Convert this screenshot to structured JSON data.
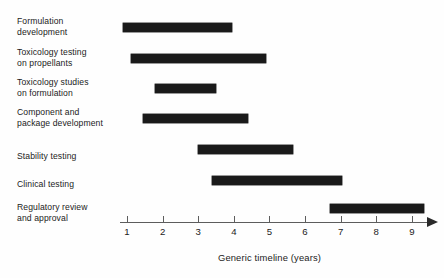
{
  "chart_data": {
    "type": "bar",
    "subtype": "gantt",
    "title": "",
    "xlabel": "Generic timeline (years)",
    "ylabel": "",
    "xlim": [
      0.6,
      9.6
    ],
    "xticks": [
      1,
      2,
      3,
      4,
      5,
      6,
      7,
      8,
      9
    ],
    "xtick_labels": [
      "1",
      "2",
      "3",
      "4",
      "5",
      "6",
      "7",
      "8",
      "9"
    ],
    "grid": false,
    "legend": false,
    "axis_arrow": true,
    "bar_color": "#1a1a1a",
    "categories": [
      "Formulation development",
      "Toxicology testing on propellants",
      "Toxicology studies on formulation",
      "Component and package development",
      "Stability testing",
      "Clinical testing",
      "Regulatory review and approval"
    ],
    "tasks": [
      {
        "label_line1": "Formulation",
        "label_line2": "development",
        "start": 0.9,
        "end": 3.95
      },
      {
        "label_line1": "Toxicology testing",
        "label_line2": "on propellants",
        "start": 1.1,
        "end": 4.9
      },
      {
        "label_line1": "Toxicology studies",
        "label_line2": "on formulation",
        "start": 1.8,
        "end": 3.5
      },
      {
        "label_line1": "Component and",
        "label_line2": "package development",
        "start": 1.45,
        "end": 4.4
      },
      {
        "label_line1": "Stability testing",
        "label_line2": "",
        "start": 3.0,
        "end": 5.65
      },
      {
        "label_line1": "Clinical testing",
        "label_line2": "",
        "start": 3.4,
        "end": 7.05
      },
      {
        "label_line1": "Regulatory review",
        "label_line2": "and approval",
        "start": 6.7,
        "end": 9.35
      }
    ]
  },
  "axis": {
    "title": "Generic timeline (years)"
  }
}
